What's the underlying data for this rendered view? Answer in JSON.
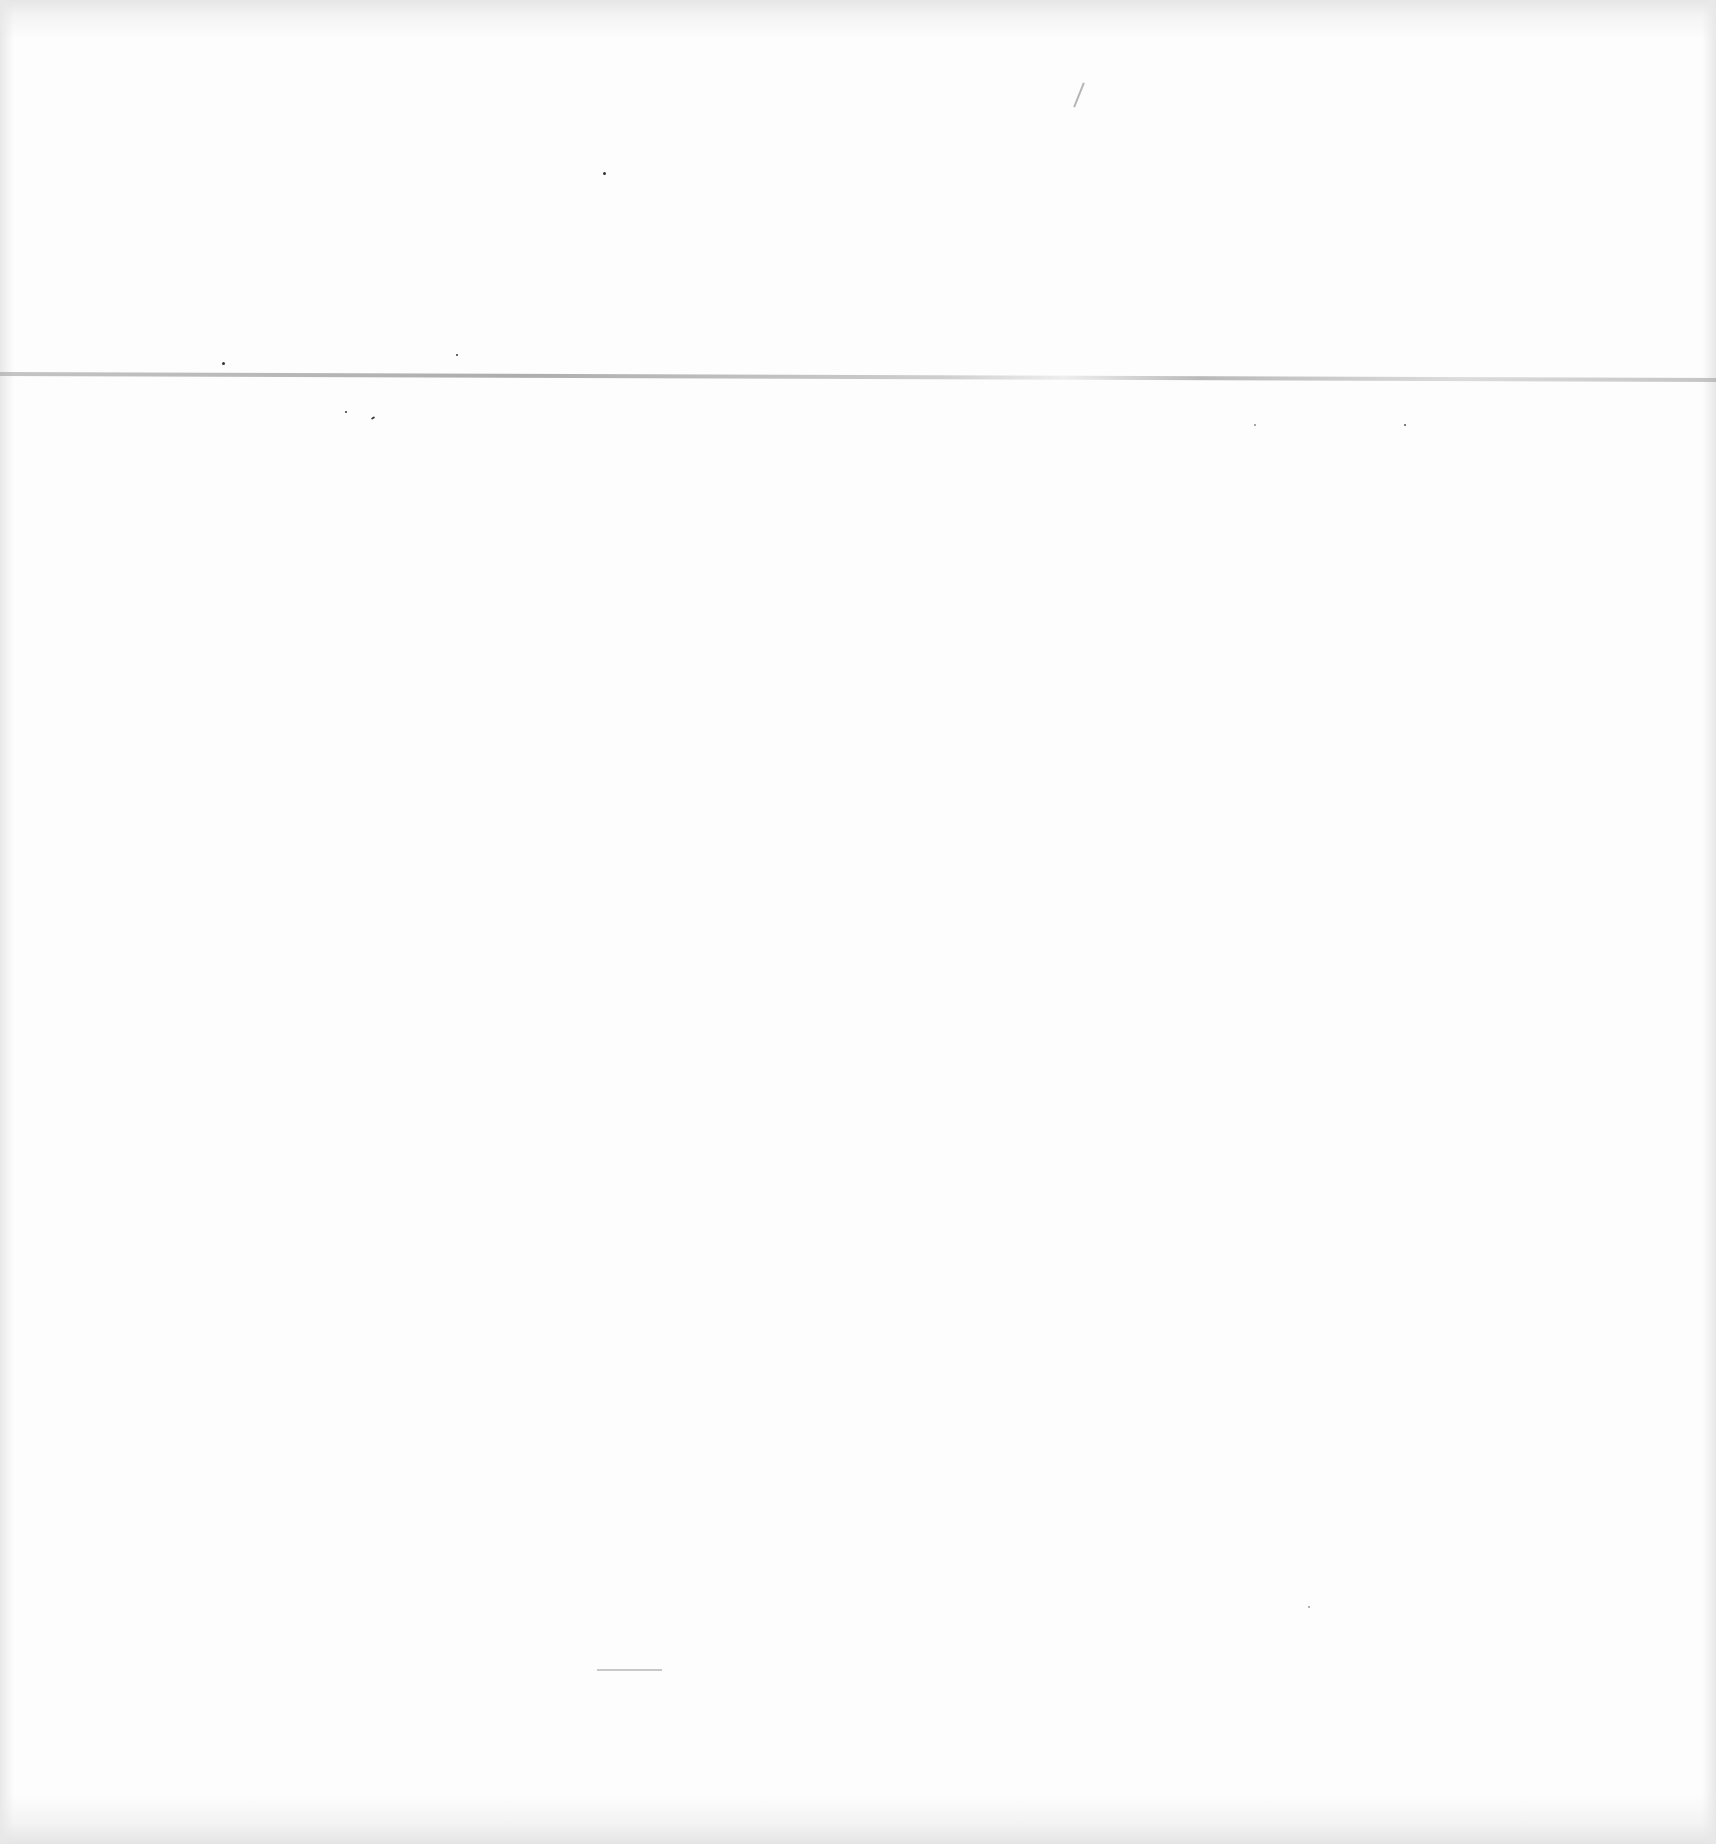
{
  "document": {
    "type": "blank scanned page",
    "text_content": [],
    "colors": {
      "paper": "#fdfdfd",
      "fold_line": "#8c8c8c",
      "rule": "#c8c8c8",
      "speck": "#333333"
    }
  }
}
